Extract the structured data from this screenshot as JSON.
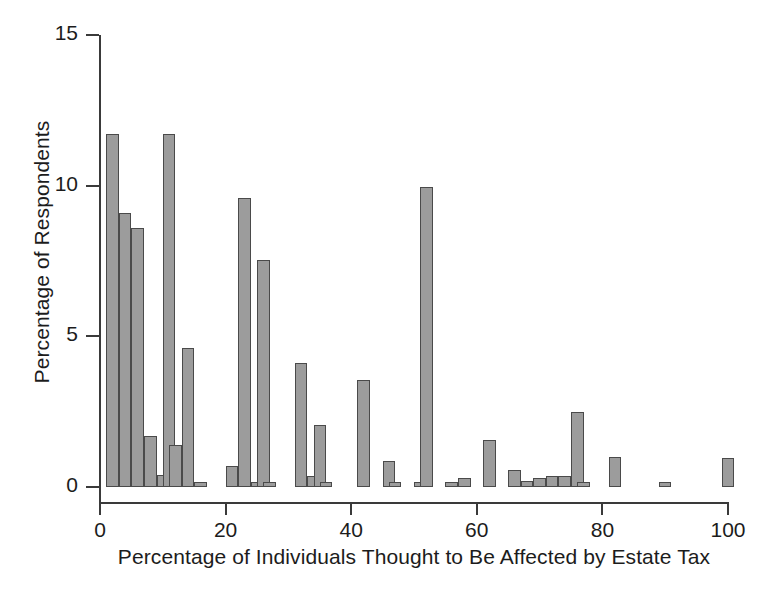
{
  "chart_data": {
    "type": "bar",
    "title": "",
    "subtitle": "",
    "xlabel": "Percentage of Individuals Thought to Be Affected by Estate Tax",
    "ylabel": "Percentage of Respondents",
    "xlim": [
      0,
      100
    ],
    "ylim": [
      0,
      15
    ],
    "xticks": [
      0,
      20,
      40,
      60,
      80,
      100
    ],
    "xtick_labels": [
      "0",
      "20",
      "40",
      "60",
      "80",
      "100"
    ],
    "yticks": [
      0,
      5,
      10,
      15
    ],
    "ytick_labels": [
      "0",
      "5",
      "10",
      "15"
    ],
    "grid": false,
    "legend": null,
    "bar_color": "#9c9c9c",
    "bar_edge_color": "#4a4a4a",
    "axis_color": "#3a3a3a",
    "bar_width": 2,
    "x": [
      1,
      3,
      5,
      7,
      9,
      10,
      11,
      13,
      15,
      20,
      22,
      24,
      25,
      26,
      31,
      33,
      34,
      35,
      41,
      45,
      46,
      50,
      51,
      55,
      57,
      61,
      65,
      67,
      69,
      71,
      73,
      75,
      76,
      81,
      89,
      99
    ],
    "values": [
      11.7,
      9.1,
      8.6,
      1.7,
      0.4,
      11.7,
      1.4,
      4.6,
      0.15,
      0.7,
      9.6,
      0.15,
      7.55,
      0.1,
      4.1,
      0.35,
      2.05,
      0.1,
      3.55,
      0.85,
      0.1,
      0.1,
      9.95,
      0.15,
      0.3,
      1.55,
      0.55,
      0.2,
      0.3,
      0.35,
      0.35,
      2.5,
      0.1,
      1.0,
      0.15,
      0.95
    ],
    "bars": [
      {
        "x": 1,
        "value": 11.7
      },
      {
        "x": 3,
        "value": 9.1
      },
      {
        "x": 5,
        "value": 8.6
      },
      {
        "x": 7,
        "value": 1.7
      },
      {
        "x": 9,
        "value": 0.4
      },
      {
        "x": 10,
        "value": 11.7
      },
      {
        "x": 11,
        "value": 1.4
      },
      {
        "x": 13,
        "value": 4.6
      },
      {
        "x": 15,
        "value": 0.15
      },
      {
        "x": 20,
        "value": 0.7
      },
      {
        "x": 22,
        "value": 9.6
      },
      {
        "x": 24,
        "value": 0.15
      },
      {
        "x": 25,
        "value": 7.55
      },
      {
        "x": 26,
        "value": 0.1
      },
      {
        "x": 31,
        "value": 4.1
      },
      {
        "x": 33,
        "value": 0.35
      },
      {
        "x": 34,
        "value": 2.05
      },
      {
        "x": 35,
        "value": 0.1
      },
      {
        "x": 41,
        "value": 3.55
      },
      {
        "x": 45,
        "value": 0.85
      },
      {
        "x": 46,
        "value": 0.1
      },
      {
        "x": 50,
        "value": 0.1
      },
      {
        "x": 51,
        "value": 9.95
      },
      {
        "x": 55,
        "value": 0.15
      },
      {
        "x": 57,
        "value": 0.3
      },
      {
        "x": 61,
        "value": 1.55
      },
      {
        "x": 65,
        "value": 0.55
      },
      {
        "x": 67,
        "value": 0.2
      },
      {
        "x": 69,
        "value": 0.3
      },
      {
        "x": 71,
        "value": 0.35
      },
      {
        "x": 73,
        "value": 0.35
      },
      {
        "x": 75,
        "value": 2.5
      },
      {
        "x": 76,
        "value": 0.1
      },
      {
        "x": 81,
        "value": 1.0
      },
      {
        "x": 89,
        "value": 0.15
      },
      {
        "x": 99,
        "value": 0.95
      }
    ]
  }
}
